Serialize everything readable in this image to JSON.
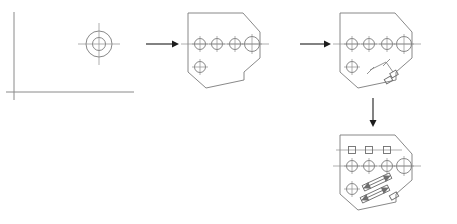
{
  "figure": {
    "background_color": "#ffffff",
    "line_color": "#7a7a7a",
    "centerline_color": "#8d8d8d",
    "arrow_color": "#1c1c1c",
    "width": 457,
    "height": 224
  },
  "panels": [
    {
      "id": "panel-1",
      "name": "coordinate-axes-and-target",
      "label": "",
      "origin": {
        "x": 14,
        "y": 92
      },
      "axes": {
        "vertical": {
          "x": 14,
          "y1": 12,
          "y2": 100
        },
        "horizontal": {
          "y": 92,
          "x1": 6,
          "x2": 134
        }
      },
      "target": {
        "cx": 99,
        "cy": 44,
        "outer_radius": 13,
        "inner_radius": 6.5,
        "crosshair_extent": 21
      }
    },
    {
      "id": "panel-2",
      "name": "plate-outline-with-holes",
      "label": "",
      "offset": {
        "x": 188,
        "y": 10
      },
      "plate_points": "0,8 0,3 55,3 72,22 72,48 56,62 56,70 18,78 0,62 0,8",
      "centerline": {
        "y": 34,
        "x1": -7,
        "x2": 81
      },
      "holes": [
        {
          "cx": 12,
          "cy": 34,
          "r": 5.5,
          "label": "hole-1"
        },
        {
          "cx": 29,
          "cy": 34,
          "r": 5.5,
          "label": "hole-2"
        },
        {
          "cx": 47,
          "cy": 34,
          "r": 5.5,
          "label": "hole-3"
        },
        {
          "cx": 64,
          "cy": 34,
          "r": 7.5,
          "label": "hole-4-large"
        },
        {
          "cx": 12,
          "cy": 57,
          "r": 5.5,
          "label": "hole-5-lower-left"
        }
      ]
    },
    {
      "id": "panel-3",
      "name": "plate-with-dimension-annotation",
      "label": "",
      "offset": {
        "x": 340,
        "y": 10
      },
      "plate_points": "0,8 0,3 55,3 72,22 72,48 56,62 56,70 18,78 0,62 0,8",
      "centerline": {
        "y": 34,
        "x1": -7,
        "x2": 81
      },
      "holes": [
        {
          "cx": 12,
          "cy": 34,
          "r": 5.5,
          "label": "hole-1"
        },
        {
          "cx": 29,
          "cy": 34,
          "r": 5.5,
          "label": "hole-2"
        },
        {
          "cx": 47,
          "cy": 34,
          "r": 5.5,
          "label": "hole-3"
        },
        {
          "cx": 64,
          "cy": 34,
          "r": 7.5,
          "label": "hole-4-large"
        },
        {
          "cx": 12,
          "cy": 57,
          "r": 5.5,
          "label": "hole-5-lower-left"
        }
      ],
      "annotation": {
        "name": "slot-dimension-detail",
        "dim_line": {
          "x1": 30,
          "y1": 60,
          "x2": 46,
          "y2": 52
        },
        "tick_a": {
          "x1": 27,
          "y1": 64,
          "x2": 34,
          "y2": 57
        },
        "tick_b": {
          "x1": 43,
          "y1": 56,
          "x2": 50,
          "y2": 49
        },
        "leader": {
          "x1": 46,
          "y1": 52,
          "x2": 53,
          "y2": 63
        },
        "slots": [
          {
            "cx": 54,
            "cy": 64,
            "w": 7,
            "h": 5,
            "rot": -30
          },
          {
            "cx": 49,
            "cy": 70,
            "w": 7,
            "h": 5,
            "rot": -30
          }
        ]
      }
    },
    {
      "id": "panel-4",
      "name": "plate-with-squares-and-section-arrows",
      "label": "",
      "offset": {
        "x": 340,
        "y": 132
      },
      "plate_points": "0,8 0,3 55,3 72,22 72,48 56,62 56,70 18,78 0,62 0,8",
      "centerline": {
        "y": 34,
        "x1": -7,
        "x2": 81
      },
      "upper_centerline": {
        "y": 18,
        "x1": -4,
        "x2": 62
      },
      "squares": [
        {
          "cx": 12,
          "cy": 18,
          "size": 7,
          "label": "square-feature-1"
        },
        {
          "cx": 29,
          "cy": 18,
          "size": 7,
          "label": "square-feature-2"
        },
        {
          "cx": 47,
          "cy": 18,
          "size": 7,
          "label": "square-feature-3"
        }
      ],
      "holes": [
        {
          "cx": 12,
          "cy": 34,
          "r": 5.5,
          "label": "hole-1"
        },
        {
          "cx": 29,
          "cy": 34,
          "r": 5.5,
          "label": "hole-2"
        },
        {
          "cx": 47,
          "cy": 34,
          "r": 5.5,
          "label": "hole-3"
        },
        {
          "cx": 64,
          "cy": 34,
          "r": 7.5,
          "label": "hole-4-large"
        },
        {
          "cx": 12,
          "cy": 57,
          "r": 5.5,
          "label": "hole-5-lower-left"
        }
      ],
      "section_bars": [
        {
          "label": "section-bar-upper",
          "x1": 24,
          "y1": 56,
          "x2": 50,
          "y2": 44,
          "thickness": 6
        },
        {
          "label": "section-bar-lower",
          "x1": 22,
          "y1": 68,
          "x2": 48,
          "y2": 56,
          "thickness": 6
        }
      ],
      "slots": [
        {
          "cx": 54,
          "cy": 64,
          "w": 8,
          "h": 5,
          "rot": -30
        }
      ]
    }
  ],
  "arrows": [
    {
      "id": "arrow-1",
      "name": "flow-arrow-step1-to-step2",
      "direction": "right",
      "x1": 146,
      "y1": 44,
      "x2": 178,
      "y2": 44
    },
    {
      "id": "arrow-2",
      "name": "flow-arrow-step2-to-step3",
      "direction": "right",
      "x1": 298,
      "y1": 44,
      "x2": 330,
      "y2": 44
    },
    {
      "id": "arrow-3",
      "name": "flow-arrow-step3-to-step4",
      "direction": "down",
      "x1": 373,
      "y1": 98,
      "x2": 373,
      "y2": 126
    }
  ]
}
